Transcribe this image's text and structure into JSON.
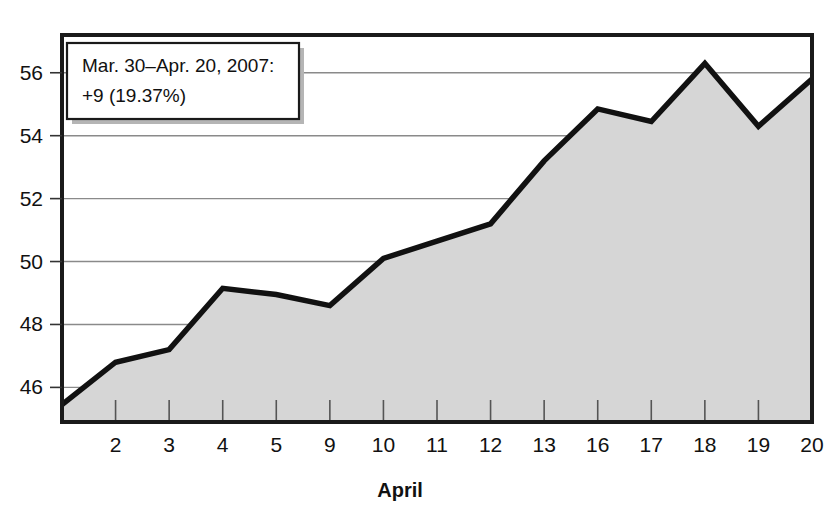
{
  "chart_data": {
    "type": "area",
    "title": "",
    "subtitle": "",
    "xlabel": "April",
    "ylabel": "",
    "grid": true,
    "legend": "none",
    "xlim": [
      0,
      15
    ],
    "ylim": [
      44.9,
      57.2
    ],
    "yticks": [
      46,
      48,
      50,
      52,
      54,
      56
    ],
    "ytick_labels": [
      "46",
      "48",
      "50",
      "52",
      "54",
      "56"
    ],
    "categories": [
      "",
      "2",
      "3",
      "4",
      "5",
      "9",
      "10",
      "11",
      "12",
      "13",
      "16",
      "17",
      "18",
      "19",
      "20"
    ],
    "x": [
      0,
      1,
      2,
      3,
      4,
      5,
      6,
      7,
      8,
      9,
      10,
      11,
      12,
      13,
      14
    ],
    "values": [
      45.45,
      46.8,
      47.2,
      49.15,
      48.95,
      48.6,
      50.1,
      50.65,
      51.2,
      53.2,
      54.85,
      54.45,
      56.3,
      54.3,
      55.8
    ],
    "series": [
      {
        "name": "price",
        "values": [
          45.45,
          46.8,
          47.2,
          49.15,
          48.95,
          48.6,
          50.1,
          50.65,
          51.2,
          53.2,
          54.85,
          54.45,
          56.3,
          54.3,
          55.8
        ]
      }
    ],
    "annotations": [
      {
        "name": "range-change-callout",
        "line1": "Mar. 30–Apr. 20, 2007:",
        "line2": "+9 (19.37%)"
      }
    ],
    "colors": {
      "area_fill": "#d6d6d6",
      "line": "#111111",
      "grid": "#8a8a8a",
      "frame": "#1a1a1a",
      "background": "#ffffff",
      "text": "#111111"
    }
  },
  "axis": {
    "x_title": "April",
    "y_tick_labels": [
      "46",
      "48",
      "50",
      "52",
      "54",
      "56"
    ],
    "x_tick_labels": [
      "2",
      "3",
      "4",
      "5",
      "9",
      "10",
      "11",
      "12",
      "13",
      "16",
      "17",
      "18",
      "19",
      "20"
    ]
  },
  "callout": {
    "line1": "Mar. 30–Apr. 20, 2007:",
    "line2": "+9 (19.37%)"
  }
}
